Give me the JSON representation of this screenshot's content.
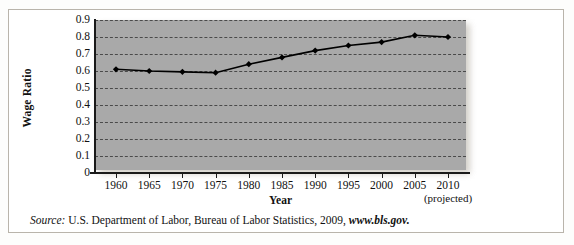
{
  "figure": {
    "source_prefix": "Source:",
    "source_body": " U.S. Department of Labor, Bureau of Labor Statistics, 2009, ",
    "source_url": "www.bls.gov.",
    "projected_note": "(projected)"
  },
  "chart_data": {
    "type": "line",
    "title": "",
    "xlabel": "Year",
    "ylabel": "Wage Ratio",
    "categories": [
      "1960",
      "1965",
      "1970",
      "1975",
      "1980",
      "1985",
      "1990",
      "1995",
      "2000",
      "2005",
      "2010"
    ],
    "x": [
      1960,
      1965,
      1970,
      1975,
      1980,
      1985,
      1990,
      1995,
      2000,
      2005,
      2010
    ],
    "values": [
      0.61,
      0.6,
      0.595,
      0.59,
      0.64,
      0.68,
      0.72,
      0.75,
      0.77,
      0.81,
      0.8
    ],
    "series": [
      {
        "name": "Wage Ratio",
        "values": [
          0.61,
          0.6,
          0.595,
          0.59,
          0.64,
          0.68,
          0.72,
          0.75,
          0.77,
          0.81,
          0.8
        ]
      }
    ],
    "ylim": [
      0,
      0.9
    ],
    "xlim": [
      1957.5,
      2012.5
    ],
    "ytick_labels": [
      "0.9",
      "0.8",
      "0.7",
      "0.6",
      "0.5",
      "0.4",
      "0.3",
      "0.2",
      "0.1",
      "0"
    ],
    "ytick_values": [
      0.9,
      0.8,
      0.7,
      0.6,
      0.5,
      0.4,
      0.3,
      0.2,
      0.1,
      0
    ],
    "grid": true,
    "grid_style": "dashed-horizontal",
    "legend": false,
    "marker": "diamond",
    "plot_background": "#a9a9a9",
    "line_color": "#000000",
    "marker_color": "#000000"
  }
}
